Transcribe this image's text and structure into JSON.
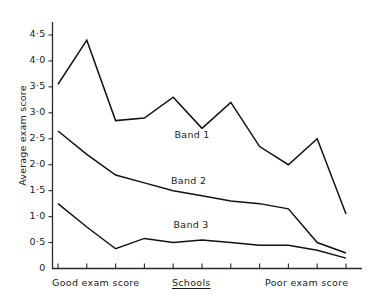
{
  "chart_data": {
    "type": "line",
    "title": "",
    "xlabel": "Schools",
    "ylabel": "Average exam score",
    "ylim": [
      0,
      4.75
    ],
    "grid": false,
    "legend_position": "inline-annotations",
    "x_axis_left_label": "Good exam score",
    "x_axis_center_label": "Schools",
    "x_axis_right_label": "Poor exam score",
    "x_tick_count": 11,
    "x": [
      1,
      2,
      3,
      4,
      5,
      6,
      7,
      8,
      9,
      10,
      11
    ],
    "ytick_labels": [
      "0",
      "0·5",
      "1·0",
      "1·5",
      "2·0",
      "2·5",
      "3·0",
      "3·5",
      "4·0",
      "4·5"
    ],
    "ytick_values": [
      0,
      0.5,
      1.0,
      1.5,
      2.0,
      2.5,
      3.0,
      3.5,
      4.0,
      4.5
    ],
    "series": [
      {
        "name": "Band 1",
        "values": [
          3.55,
          4.4,
          2.85,
          2.9,
          3.3,
          2.7,
          3.2,
          2.35,
          2.0,
          2.5,
          1.05
        ]
      },
      {
        "name": "Band 2",
        "values": [
          2.65,
          2.2,
          1.8,
          1.65,
          1.5,
          1.4,
          1.3,
          1.25,
          1.15,
          0.5,
          0.3
        ]
      },
      {
        "name": "Band 3",
        "values": [
          1.25,
          0.8,
          0.38,
          0.58,
          0.5,
          0.55,
          0.5,
          0.45,
          0.45,
          0.35,
          0.2
        ]
      }
    ],
    "annotations": [
      {
        "text": "Band 1",
        "series": "Band 1"
      },
      {
        "text": "Band 2",
        "series": "Band 2"
      },
      {
        "text": "Band 3",
        "series": "Band 3"
      }
    ]
  },
  "axis": {
    "y_title": "Average exam score",
    "x_left": "Good exam score",
    "x_center": "Schools",
    "x_right": "Poor exam score"
  },
  "labels": {
    "band1": "Band 1",
    "band2": "Band 2",
    "band3": "Band 3"
  },
  "colors": {
    "line": "#111111",
    "axis": "#2a2a2a",
    "background": "#ffffff",
    "text": "#1a1a1a"
  }
}
